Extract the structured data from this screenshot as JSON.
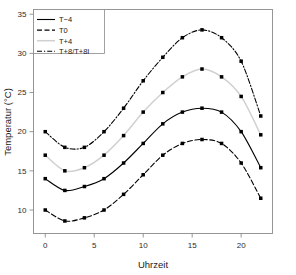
{
  "chart_data": {
    "type": "line",
    "title": "",
    "xlabel": "Uhrzeit",
    "ylabel": "Temperatur (°C)",
    "xlim": [
      -1.2,
      23.2
    ],
    "ylim": [
      7.0,
      35.6
    ],
    "xticks": [
      0,
      5,
      10,
      15,
      20
    ],
    "yticks": [
      10,
      15,
      20,
      25,
      30,
      35
    ],
    "xtick_labels": [
      "0",
      "5",
      "10",
      "15",
      "20"
    ],
    "ytick_labels": [
      "10",
      "15",
      "20",
      "25",
      "30",
      "35"
    ],
    "grid": false,
    "legend_position": "top-left",
    "x": [
      0,
      2,
      4,
      6,
      8,
      10,
      12,
      14,
      16,
      18,
      20,
      22
    ],
    "series": [
      {
        "name": "T−4",
        "style": "solid",
        "color": "#000000",
        "marker": "square",
        "values": [
          14.0,
          12.5,
          13.0,
          14.0,
          16.0,
          18.5,
          21.0,
          22.5,
          23.0,
          22.5,
          20.0,
          15.4
        ]
      },
      {
        "name": "T0",
        "style": "dashed",
        "color": "#000000",
        "marker": "square",
        "values": [
          10.0,
          8.6,
          9.0,
          10.0,
          12.0,
          14.5,
          17.0,
          18.5,
          19.0,
          18.5,
          16.0,
          11.5
        ]
      },
      {
        "name": "T+4",
        "style": "solid-light",
        "color": "#d0d0d0",
        "marker": "square",
        "values": [
          17.0,
          15.0,
          15.4,
          17.0,
          19.5,
          22.5,
          25.0,
          27.0,
          28.0,
          27.0,
          24.5,
          19.6
        ]
      },
      {
        "name": "T+8/T+8I",
        "style": "dash-dot",
        "color": "#000000",
        "marker": "square",
        "values": [
          20.0,
          18.0,
          18.0,
          20.0,
          23.0,
          26.5,
          29.5,
          32.0,
          33.0,
          32.0,
          29.0,
          22.0
        ]
      }
    ]
  },
  "legend": {
    "entries": [
      {
        "label": "T−4"
      },
      {
        "label": "T0"
      },
      {
        "label": "T+4"
      },
      {
        "label": "T+8/T+8I"
      }
    ]
  },
  "axes": {
    "x_title": "Uhrzeit",
    "y_title": "Temperatur (°C)"
  }
}
